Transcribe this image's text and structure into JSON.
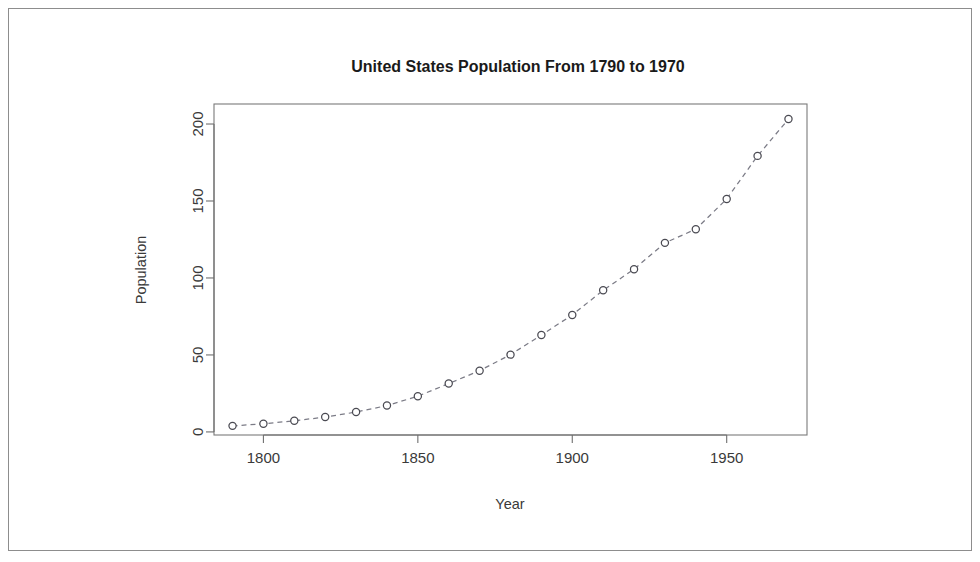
{
  "figure": {
    "background_color": "#ffffff",
    "frame_color": "#8d8d8d",
    "panel_border_color": "#7a7a7a"
  },
  "chart_data": {
    "type": "line",
    "title": "United States Population From 1790 to 1970",
    "xlabel": "Year",
    "ylabel": "Population",
    "x": [
      1790,
      1800,
      1810,
      1820,
      1830,
      1840,
      1850,
      1860,
      1870,
      1880,
      1890,
      1900,
      1910,
      1920,
      1930,
      1940,
      1950,
      1960,
      1970
    ],
    "values": [
      3.93,
      5.31,
      7.24,
      9.64,
      12.9,
      17.1,
      23.2,
      31.4,
      39.8,
      50.2,
      62.9,
      76.0,
      92.0,
      105.7,
      122.8,
      131.7,
      151.3,
      179.3,
      203.2
    ],
    "series": [
      {
        "name": "Population",
        "values": [
          3.93,
          5.31,
          7.24,
          9.64,
          12.9,
          17.1,
          23.2,
          31.4,
          39.8,
          50.2,
          62.9,
          76.0,
          92.0,
          105.7,
          122.8,
          131.7,
          151.3,
          179.3,
          203.2
        ],
        "line_style": "dashed",
        "marker": "open-circle",
        "line_color": "#7b7b86",
        "marker_color": "#4a4a52"
      }
    ],
    "xlim": [
      1784,
      1976
    ],
    "ylim": [
      -2,
      213
    ],
    "xticks": [
      1800,
      1850,
      1900,
      1950
    ],
    "xtick_labels": [
      "1800",
      "1850",
      "1900",
      "1950"
    ],
    "yticks": [
      0,
      50,
      100,
      150,
      200
    ],
    "ytick_labels": [
      "0",
      "50",
      "100",
      "150",
      "200"
    ],
    "grid": false,
    "legend": false,
    "ylabel_rotation": 90,
    "ytick_label_rotation": 90
  }
}
